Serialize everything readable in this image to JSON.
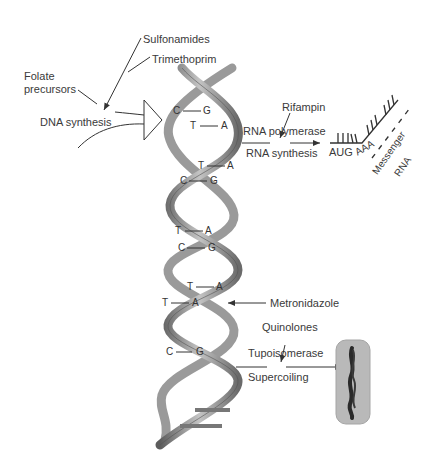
{
  "labels": {
    "sulfonamides": "Sulfonamides",
    "trimethoprim": "Trimethoprim",
    "folate_line1": "Folate",
    "folate_line2": "precursors",
    "dna_synthesis": "DNA synthesis",
    "rifampin": "Rifampin",
    "rna_polymerase": "RNA polymerase",
    "rna_synthesis": "RNA synthesis",
    "aug": "AUG",
    "aaa": "AAA",
    "messenger": "Messenger",
    "rna": "RNA",
    "metronidazole": "Metronidazole",
    "quinolones": "Quinolones",
    "topoisomerase": "Tupoisomerase",
    "supercoiling": "Supercoiling"
  },
  "base_pairs": [
    {
      "left": "C",
      "right": "G"
    },
    {
      "left": "T",
      "right": "A"
    },
    {
      "left": "T",
      "right": "A"
    },
    {
      "left": "C",
      "right": "G"
    },
    {
      "left": "T",
      "right": "A"
    },
    {
      "left": "C",
      "right": "G"
    },
    {
      "left": "T",
      "right": "A"
    },
    {
      "left": "T",
      "right": "A"
    },
    {
      "left": "C",
      "right": "G"
    }
  ],
  "colors": {
    "helix_dark": "#6f6f6f",
    "helix_light": "#b8b8b8",
    "bacterium_fill": "#b9b9b9",
    "chromosome": "#2a2a2a",
    "line": "#333333"
  }
}
